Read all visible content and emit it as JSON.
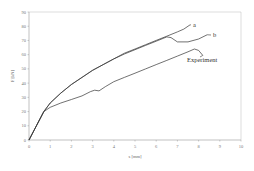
{
  "chart_data": {
    "type": "line",
    "title": "",
    "xlabel": "s [mm]",
    "ylabel": "F [kN]",
    "xlim": [
      0,
      10
    ],
    "ylim": [
      0,
      90
    ],
    "xticks": [
      0,
      1,
      2,
      3,
      4,
      5,
      6,
      7,
      8,
      9,
      10
    ],
    "yticks": [
      0,
      10,
      20,
      30,
      40,
      50,
      60,
      70,
      80,
      90
    ],
    "grid": false,
    "legend": "inline labels at line ends",
    "series": [
      {
        "name": "a",
        "x": [
          0,
          0.35,
          0.7,
          1.0,
          1.5,
          2.0,
          2.5,
          3.0,
          3.5,
          4.0,
          4.5,
          5.0,
          5.5,
          6.0,
          6.5,
          7.0,
          7.3,
          7.6
        ],
        "y": [
          0,
          10,
          20,
          26,
          33,
          39,
          44,
          49,
          53,
          57,
          61,
          64,
          67,
          70,
          73,
          76,
          78,
          81
        ]
      },
      {
        "name": "b",
        "x": [
          0,
          0.35,
          0.7,
          1.0,
          1.5,
          2.0,
          2.5,
          3.0,
          3.5,
          4.0,
          4.5,
          5.0,
          5.5,
          6.0,
          6.5,
          6.7,
          7.0,
          7.5,
          8.0,
          8.4
        ],
        "y": [
          0,
          10,
          20,
          26,
          33,
          39,
          44,
          49,
          53,
          57,
          60.5,
          63.5,
          66.5,
          69.5,
          72.5,
          72,
          69,
          69,
          71,
          74
        ]
      },
      {
        "name": "Experiment",
        "x": [
          0,
          0.35,
          0.7,
          1.0,
          1.5,
          2.0,
          2.5,
          2.9,
          3.1,
          3.3,
          3.6,
          4.0,
          4.5,
          5.0,
          5.5,
          6.0,
          6.5,
          7.0,
          7.5,
          7.8,
          8.0,
          8.2
        ],
        "y": [
          0,
          10,
          20,
          23,
          26,
          28.5,
          31,
          34,
          35,
          34.5,
          37.5,
          41,
          44,
          47,
          50,
          53,
          56,
          59,
          62,
          64,
          63,
          59.5
        ]
      }
    ]
  },
  "labels": {
    "x_axis": "s [mm]",
    "y_axis": "F [kN]",
    "series_a": "a",
    "series_b": "b",
    "series_exp": "Experiment"
  },
  "colors": {
    "axis": "#999999",
    "line": "#333333",
    "frame": "#bbbbbb"
  }
}
